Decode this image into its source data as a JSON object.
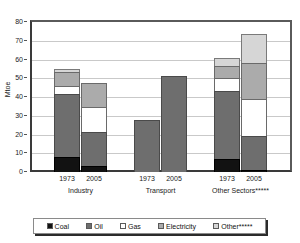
{
  "chart_data": {
    "type": "bar",
    "subtype": "stacked-grouped",
    "title": "",
    "xlabel": "",
    "ylabel": "Mtoe",
    "ylim": [
      0,
      80
    ],
    "ytick_labels": [
      "0",
      "10",
      "20",
      "30",
      "40",
      "50",
      "60",
      "70",
      "80"
    ],
    "ytick_values": [
      0,
      10,
      20,
      30,
      40,
      50,
      60,
      70,
      80
    ],
    "grid": true,
    "legend_position": "bottom",
    "groups": [
      "Industry",
      "Transport",
      "Other Sectors*****"
    ],
    "categories": [
      "1973",
      "2005",
      "1973",
      "2005",
      "1973",
      "2005"
    ],
    "series": [
      {
        "name": "Coal",
        "color": "#121212",
        "values": [
          8,
          3,
          0,
          0,
          7,
          1
        ]
      },
      {
        "name": "Oil",
        "color": "#6e6e6e",
        "values": [
          34,
          19,
          27.5,
          51,
          37,
          19
        ]
      },
      {
        "name": "Gas",
        "color": "#ffffff",
        "values": [
          5,
          14,
          0,
          0,
          7,
          20
        ]
      },
      {
        "name": "Electricity",
        "color": "#ababab",
        "values": [
          8,
          13,
          0,
          0,
          7,
          20
        ]
      },
      {
        "name": "Other*****",
        "color": "#d6d6d6",
        "values": [
          2,
          0,
          0,
          0,
          5,
          16
        ]
      }
    ],
    "totals": [
      57,
      49,
      27.5,
      51,
      63,
      76
    ]
  },
  "axis": {
    "y_title": "Mtoe",
    "ticks": [
      {
        "label": "80",
        "value": 80
      },
      {
        "label": "70",
        "value": 70
      },
      {
        "label": "60",
        "value": 60
      },
      {
        "label": "50",
        "value": 50
      },
      {
        "label": "40",
        "value": 40
      },
      {
        "label": "30",
        "value": 30
      },
      {
        "label": "20",
        "value": 20
      },
      {
        "label": "10",
        "value": 10
      },
      {
        "label": "0",
        "value": 0
      }
    ]
  },
  "x_axis": {
    "years": [
      "1973",
      "2005",
      "1973",
      "2005",
      "1973",
      "2005"
    ],
    "groups": [
      "Industry",
      "Transport",
      "Other Sectors*****"
    ]
  },
  "legend": {
    "items": [
      {
        "label": "Coal",
        "color": "#121212"
      },
      {
        "label": "Oil",
        "color": "#6e6e6e"
      },
      {
        "label": "Gas",
        "color": "#ffffff"
      },
      {
        "label": "Electricity",
        "color": "#ababab"
      },
      {
        "label": "Other*****",
        "color": "#d6d6d6"
      }
    ]
  }
}
